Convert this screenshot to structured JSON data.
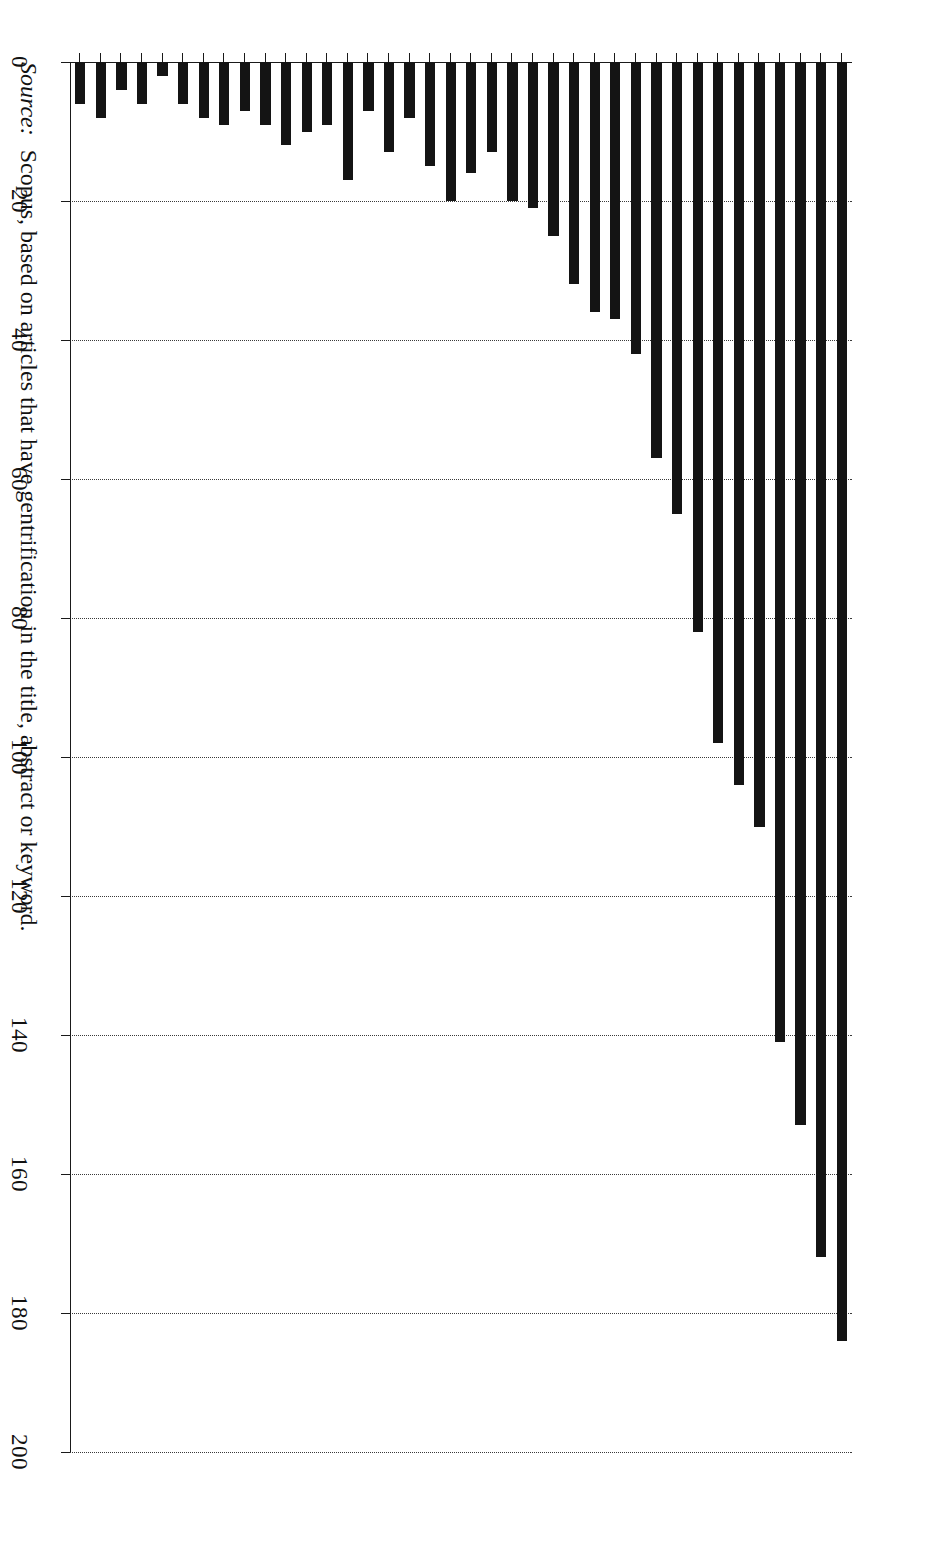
{
  "chart_data": {
    "type": "bar",
    "orientation": "horizontal",
    "title": "",
    "subtitle": "",
    "xlabel": "",
    "ylabel": "",
    "xlim": [
      0,
      200
    ],
    "ylim": null,
    "grid": true,
    "grid_axis": "x",
    "legend": false,
    "legend_position": "none",
    "bar_color": "#141414",
    "categories": [
      "2016",
      "2015",
      "2014",
      "2013",
      "2012",
      "2011",
      "2010",
      "2009",
      "2008",
      "2007",
      "2006",
      "2005",
      "2004",
      "2003",
      "2002",
      "2001",
      "2000",
      "1999",
      "1998",
      "1997",
      "1996",
      "1995",
      "1994",
      "1993",
      "1992",
      "1991",
      "1990",
      "1989",
      "1988",
      "1987",
      "1986",
      "1985",
      "1984",
      "1983",
      "1982",
      "1981",
      "1980",
      "1979"
    ],
    "values": [
      184,
      172,
      153,
      141,
      110,
      104,
      98,
      82,
      65,
      57,
      42,
      37,
      36,
      32,
      25,
      21,
      20,
      13,
      16,
      20,
      15,
      8,
      13,
      7,
      17,
      9,
      10,
      12,
      9,
      7,
      9,
      8,
      6,
      2,
      6,
      4,
      8,
      6
    ],
    "xticks": [
      0,
      20,
      40,
      60,
      80,
      100,
      120,
      140,
      160,
      180,
      200
    ],
    "xticklabels": [
      "0",
      "20",
      "40",
      "60",
      "80",
      "100",
      "120",
      "140",
      "160",
      "180",
      "200"
    ]
  },
  "source": {
    "label": "Source:",
    "text": "Scopus, based on articles that have gentrification in the title, abstract or keyword."
  }
}
